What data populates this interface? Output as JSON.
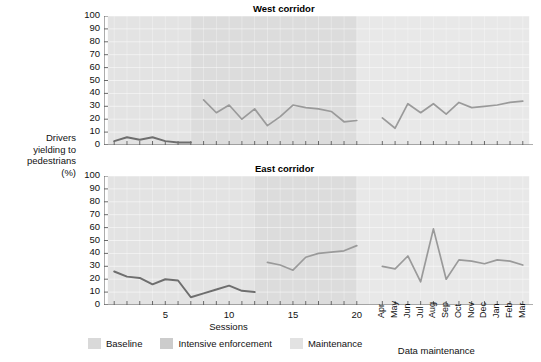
{
  "figure": {
    "y_axis_label_lines": [
      "Drivers",
      "yielding to",
      "pedestrians",
      "(%)"
    ],
    "x_axis_caption_left": "Sessions",
    "x_axis_caption_right": "Data maintenance"
  },
  "legend": {
    "items": [
      {
        "label": "Baseline",
        "color": "#d9d9d9"
      },
      {
        "label": "Intensive enforcement",
        "color": "#cccccc"
      },
      {
        "label": "Maintenance",
        "color": "#e2e2e2"
      }
    ]
  },
  "chart_data": [
    {
      "type": "line",
      "title": "West corridor",
      "ylabel": "Drivers yielding to pedestrians (%)",
      "xlabel": "Sessions / Data maintenance",
      "ylim": [
        0,
        100
      ],
      "ytick_labels": [
        "100",
        "90",
        "80",
        "70",
        "60",
        "50",
        "40",
        "30",
        "20",
        "10",
        "0"
      ],
      "ytick_values": [
        100,
        90,
        80,
        70,
        60,
        50,
        40,
        30,
        20,
        10,
        0
      ],
      "grid": true,
      "legend_position": "bottom",
      "session_tick_labels": [
        "5",
        "10",
        "15",
        "20"
      ],
      "session_tick_values": [
        5,
        10,
        15,
        20
      ],
      "month_tick_labels": [
        "Apr",
        "May",
        "Jun",
        "Jul",
        "Aug",
        "Sep",
        "Oct",
        "Nov",
        "Dec",
        "Jan",
        "Feb",
        "Mar"
      ],
      "phases": [
        {
          "name": "Baseline",
          "x_start": 1,
          "x_end": 7.5,
          "color": "#e3e3e3"
        },
        {
          "name": "Intensive enforcement",
          "x_start": 7.5,
          "x_end": 20.5,
          "color": "#dcdcdc"
        },
        {
          "name": "Maintenance",
          "x_start": 20.5,
          "x_end": 33,
          "color": "#e8e8e8"
        }
      ],
      "series": [
        {
          "name": "Baseline",
          "color": "#6e6e6e",
          "x": [
            1,
            2,
            3,
            4,
            5,
            6,
            7
          ],
          "values": [
            3,
            6,
            4,
            6,
            3,
            2,
            2
          ]
        },
        {
          "name": "Intensive enforcement",
          "color": "#9a9a9a",
          "x": [
            8,
            9,
            10,
            11,
            12,
            13,
            14,
            15,
            16,
            17,
            18,
            19,
            20
          ],
          "values": [
            35,
            25,
            31,
            20,
            28,
            15,
            22,
            31,
            29,
            28,
            26,
            18,
            19
          ]
        },
        {
          "name": "Maintenance",
          "color": "#9a9a9a",
          "x": [
            22,
            23,
            24,
            25,
            26,
            27,
            28,
            29,
            30,
            31,
            32,
            33
          ],
          "values": [
            21,
            13,
            32,
            25,
            32,
            24,
            33,
            29,
            30,
            31,
            33,
            34
          ]
        }
      ]
    },
    {
      "type": "line",
      "title": "East corridor",
      "ylabel": "Drivers yielding to pedestrians (%)",
      "xlabel": "Sessions / Data maintenance",
      "ylim": [
        0,
        100
      ],
      "ytick_labels": [
        "100",
        "90",
        "80",
        "70",
        "60",
        "50",
        "40",
        "30",
        "20",
        "10",
        "0"
      ],
      "ytick_values": [
        100,
        90,
        80,
        70,
        60,
        50,
        40,
        30,
        20,
        10,
        0
      ],
      "grid": true,
      "legend_position": "bottom",
      "session_tick_labels": [
        "5",
        "10",
        "15",
        "20"
      ],
      "session_tick_values": [
        5,
        10,
        15,
        20
      ],
      "month_tick_labels": [
        "Apr",
        "May",
        "Jun",
        "Jul",
        "Aug",
        "Sep",
        "Oct",
        "Nov",
        "Dec",
        "Jan",
        "Feb",
        "Mar"
      ],
      "phases": [
        {
          "name": "Baseline",
          "x_start": 1,
          "x_end": 12.5,
          "color": "#e3e3e3"
        },
        {
          "name": "Intensive enforcement",
          "x_start": 12.5,
          "x_end": 20.5,
          "color": "#dcdcdc"
        },
        {
          "name": "Maintenance",
          "x_start": 20.5,
          "x_end": 33,
          "color": "#e8e8e8"
        }
      ],
      "series": [
        {
          "name": "Baseline",
          "color": "#6e6e6e",
          "x": [
            1,
            2,
            3,
            4,
            5,
            6,
            7,
            8,
            9,
            10,
            11,
            12
          ],
          "values": [
            26,
            22,
            21,
            16,
            20,
            19,
            6,
            9,
            12,
            15,
            11,
            10
          ]
        },
        {
          "name": "Intensive enforcement",
          "color": "#9a9a9a",
          "x": [
            13,
            14,
            15,
            16,
            17,
            18,
            19,
            20
          ],
          "values": [
            33,
            31,
            27,
            37,
            40,
            41,
            42,
            46
          ]
        },
        {
          "name": "Maintenance",
          "color": "#9a9a9a",
          "x": [
            22,
            23,
            24,
            25,
            26,
            27,
            28,
            29,
            30,
            31,
            32,
            33
          ],
          "values": [
            30,
            28,
            38,
            18,
            59,
            20,
            35,
            34,
            32,
            35,
            34,
            31
          ]
        }
      ]
    }
  ]
}
